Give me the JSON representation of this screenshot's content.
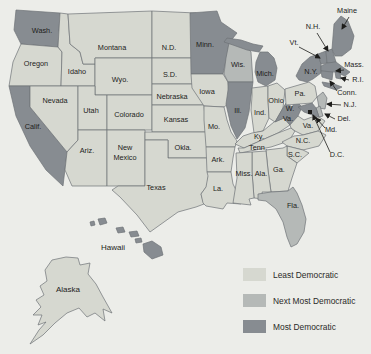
{
  "figure": {
    "type": "us-map-choropleth"
  },
  "colors": {
    "background": "#ecede9",
    "state_border": "#6e7377",
    "label_text": "#1d1d1b",
    "dc_marker": "#1d1d1b"
  },
  "legend": {
    "colors": {
      "least": "#d6d8d0",
      "next": "#b5b9b7",
      "most": "#878c91"
    },
    "items": [
      {
        "key": "least",
        "label": "Least Democratic"
      },
      {
        "key": "next",
        "label": "Next Most Democratic"
      },
      {
        "key": "most",
        "label": "Most Democratic"
      }
    ]
  },
  "map": {
    "labels": {
      "wash": "Wash.",
      "oregon": "Oregon",
      "calif": "Calif.",
      "idaho": "Idaho",
      "montana": "Montana",
      "nevada": "Nevada",
      "utah": "Utah",
      "wyo": "Wyo.",
      "colorado": "Colorado",
      "ariz": "Ariz.",
      "new_mexico_1": "New",
      "new_mexico_2": "Mexico",
      "nd": "N.D.",
      "sd": "S.D.",
      "nebraska": "Nebraska",
      "kansas": "Kansas",
      "okla": "Okla.",
      "texas": "Texas",
      "minn": "Minn.",
      "iowa": "Iowa",
      "mo": "Mo.",
      "ark": "Ark.",
      "la": "La.",
      "wis": "Wis.",
      "ill": "Ill.",
      "ind": "Ind.",
      "ohio": "Ohio",
      "mich": "Mich.",
      "ky": "Ky.",
      "tenn": "Tenn.",
      "miss": "Miss.",
      "ala": "Ala.",
      "ga": "Ga.",
      "fla": "Fla.",
      "sc": "S.C.",
      "nc": "N.C.",
      "va": "Va.",
      "wva_1": "W.",
      "wva_2": "Va.",
      "pa": "Pa.",
      "ny": "N.Y.",
      "nj": "N.J.",
      "del": "Del.",
      "md": "Md.",
      "dc": "D.C.",
      "conn": "Conn.",
      "ri": "R.I.",
      "mass": "Mass.",
      "vt": "Vt.",
      "nh": "N.H.",
      "maine": "Maine",
      "hawaii": "Hawaii",
      "alaska": "Alaska"
    },
    "categories": {
      "wash": "most",
      "calif": "most",
      "minn": "most",
      "mich": "most",
      "ill": "most",
      "wva": "most",
      "ny": "most",
      "vt": "most",
      "nh": "most",
      "maine": "most",
      "mass": "most",
      "ri": "most",
      "conn": "most",
      "md": "most",
      "hawaii": "most",
      "wis": "next",
      "fla": "next",
      "nj": "next",
      "del": "next",
      "oregon": "least",
      "idaho": "least",
      "montana": "least",
      "nevada": "least",
      "utah": "least",
      "wyo": "least",
      "colorado": "least",
      "ariz": "least",
      "new_mexico": "least",
      "nd": "least",
      "sd": "least",
      "nebraska": "least",
      "kansas": "least",
      "okla": "least",
      "texas": "least",
      "iowa": "least",
      "mo": "least",
      "ark": "least",
      "la": "least",
      "ind": "least",
      "ohio": "least",
      "ky": "least",
      "tenn": "least",
      "miss": "least",
      "ala": "least",
      "ga": "least",
      "sc": "least",
      "nc": "least",
      "va": "least",
      "pa": "least",
      "alaska": "least"
    }
  }
}
